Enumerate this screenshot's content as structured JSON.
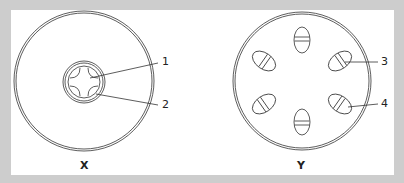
{
  "diagram": {
    "background_color": "#cdcdcd",
    "panel_color": "#ffffff",
    "figures": [
      {
        "caption": "X",
        "description": "Large double-ring circle with a small central double ring containing a four-lobed cross shape",
        "labels": [
          {
            "text": "1",
            "points_to": "central cross"
          },
          {
            "text": "2",
            "points_to": "inner ring lobe"
          }
        ]
      },
      {
        "caption": "Y",
        "description": "Large double-ring circle with six oval bodies arranged radially, each with two parallel bands",
        "labels": [
          {
            "text": "3",
            "points_to": "upper-right oval"
          },
          {
            "text": "4",
            "points_to": "lower-right oval"
          }
        ]
      }
    ]
  }
}
